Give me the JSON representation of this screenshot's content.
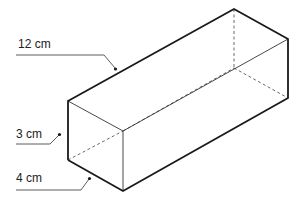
{
  "diagram": {
    "type": "rectangular-prism",
    "colors": {
      "stroke": "#1a1a1a",
      "thin": "#333333",
      "text": "#222222"
    },
    "labels": [
      {
        "id": "length",
        "text": "12 cm"
      },
      {
        "id": "height",
        "text": "3 cm"
      },
      {
        "id": "width",
        "text": "4 cm"
      }
    ]
  }
}
